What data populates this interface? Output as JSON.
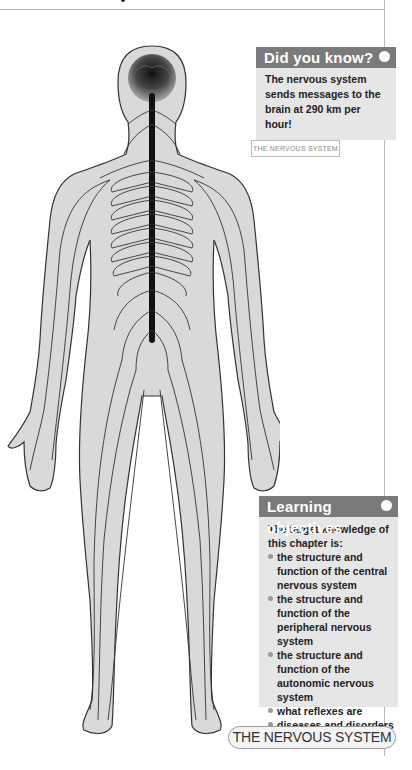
{
  "page": {
    "did_you_know": {
      "heading": "Did you know?",
      "icon": "dot-icon",
      "body": "The nervous system sends messages to the brain at 290 km per hour!"
    },
    "figure": {
      "caption_label": "THE NERVOUS SYSTEM",
      "description": "Front view diagram of a human body showing the brain, spinal cord and branching nerves"
    },
    "learning_objectives": {
      "heading": "Learning objectives",
      "icon": "dot-icon",
      "intro": "The target knowledge of this chapter is:",
      "items": [
        "the structure and function of the central nervous system",
        "the structure and function of the peripheral nervous system",
        "the structure and function of the autonomic nervous system",
        "what reflexes are",
        "diseases and disorders of the nervous system."
      ]
    },
    "chapter_tab": "THE NERVOUS SYSTEM",
    "colors": {
      "box_header": "#7a7a7a",
      "box_fill": "#e6e6e6",
      "body_fill": "#d9d9d9",
      "nerve": "#1a1a1a"
    }
  }
}
